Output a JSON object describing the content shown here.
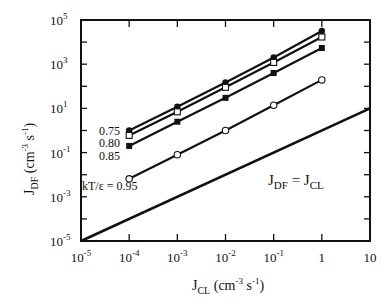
{
  "chart_data": {
    "type": "line",
    "title": "",
    "xlabel": "J_CL (cm^-3 s^-1)",
    "ylabel": "J_DF (cm^-3 s^-1)",
    "xscale": "log",
    "yscale": "log",
    "xlim": [
      1e-05,
      10
    ],
    "ylim": [
      1e-05,
      100000.0
    ],
    "grid": false,
    "legend_position": "inline labels at left end of each series",
    "x_tick_labels": [
      "10^-5",
      "10^-4",
      "10^-3",
      "10^-2",
      "10^-1",
      "1",
      "10"
    ],
    "y_tick_labels": [
      "10^-5",
      "10^-3",
      "10^-1",
      "10^1",
      "10^3",
      "10^5"
    ],
    "x": [
      0.0001,
      0.001,
      0.01,
      0.1,
      1
    ],
    "series": [
      {
        "name": "kT/ε = 0.75",
        "label": "0.75",
        "marker": "filled-circle",
        "values": [
          1.0,
          12,
          150,
          2000,
          32000
        ]
      },
      {
        "name": "kT/ε = 0.80",
        "label": "0.80",
        "marker": "open-square",
        "values": [
          0.6,
          7,
          90,
          1200,
          17000
        ]
      },
      {
        "name": "kT/ε = 0.85",
        "label": "0.85",
        "marker": "filled-square",
        "values": [
          0.2,
          2.5,
          30,
          400,
          5400
        ]
      },
      {
        "name": "kT/ε = 0.95",
        "label": "kT/ε = 0.95",
        "marker": "open-circle",
        "values": [
          0.0065,
          0.08,
          1.0,
          14,
          195
        ]
      }
    ],
    "reference_line": {
      "name": "J_DF = J_CL",
      "x": [
        1e-05,
        10
      ],
      "y": [
        1e-05,
        10
      ]
    },
    "annotations": [
      "0.75",
      "0.80",
      "0.85",
      "kT/ε = 0.95",
      "J_DF = J_CL"
    ]
  },
  "labels": {
    "x_axis_main": "J",
    "x_axis_sub": "CL",
    "x_axis_units_open": " (cm",
    "x_axis_units_exp1": "-3",
    "x_axis_units_mid": " s",
    "x_axis_units_exp2": "-1",
    "x_axis_units_close": ")",
    "y_axis_main": "J",
    "y_axis_sub": "DF",
    "y_axis_units_open": " (cm",
    "y_axis_units_exp1": "-3",
    "y_axis_units_mid": " s",
    "y_axis_units_exp2": "-1",
    "y_axis_units_close": ")",
    "eq_j1": "J",
    "eq_sub1": "DF",
    "eq_mid": " = J",
    "eq_sub2": "CL",
    "series_075": "0.75",
    "series_080": "0.80",
    "series_085": "0.85",
    "series_095": "kT/ε = 0.95"
  },
  "x_ticks": [
    {
      "base": "10",
      "exp": "-5"
    },
    {
      "base": "10",
      "exp": "-4"
    },
    {
      "base": "10",
      "exp": "-3"
    },
    {
      "base": "10",
      "exp": "-2"
    },
    {
      "base": "10",
      "exp": "-1"
    },
    {
      "base": "1",
      "exp": ""
    },
    {
      "base": "10",
      "exp": ""
    }
  ],
  "y_ticks": [
    {
      "base": "10",
      "exp": "5"
    },
    {
      "base": "10",
      "exp": "3"
    },
    {
      "base": "10",
      "exp": "1"
    },
    {
      "base": "10",
      "exp": "-1"
    },
    {
      "base": "10",
      "exp": "-3"
    },
    {
      "base": "10",
      "exp": "-5"
    }
  ]
}
